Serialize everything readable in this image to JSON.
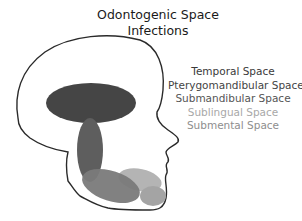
{
  "title_line1": "Odontogenic Space",
  "title_line2": "Infections",
  "legend": [
    {
      "label": "Temporal Space",
      "color": "#3a3a3a"
    },
    {
      "label": "Pterygomandibular Space",
      "color": "#444444"
    },
    {
      "label": "Submandibular Space",
      "color": "#555555"
    },
    {
      "label": "Sublingual Space",
      "color": "#a8a8a8"
    },
    {
      "label": "Submental Space",
      "color": "#8e8e8e"
    }
  ],
  "colors": {
    "outline": "#2a2a2a",
    "temporal": "#454545",
    "pterygomandibular": "#5e5e5e",
    "submandibular": "#7a7a7a",
    "sublingual": "#b4b4b4",
    "submental": "#a4a4a4"
  }
}
